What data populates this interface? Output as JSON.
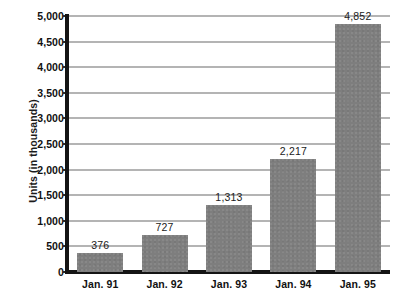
{
  "chart_data": {
    "type": "bar",
    "title": "",
    "subtitle": "",
    "xlabel": "",
    "ylabel": "Units (in thousands)",
    "categories": [
      "Jan. 91",
      "Jan. 92",
      "Jan. 93",
      "Jan. 94",
      "Jan. 95"
    ],
    "values": [
      376,
      727,
      1313,
      2217,
      4852
    ],
    "value_labels": [
      "376",
      "727",
      "1,313",
      "2,217",
      "4,852"
    ],
    "ylim": [
      0,
      5000
    ],
    "ytick_step": 500,
    "yticks": [
      0,
      500,
      1000,
      1500,
      2000,
      2500,
      3000,
      3500,
      4000,
      4500,
      5000
    ],
    "ytick_labels": [
      "0",
      "500",
      "1,000",
      "1,500",
      "2,000",
      "2,500",
      "3,000",
      "3,500",
      "4,000",
      "4,500",
      "5,000"
    ],
    "grid": true,
    "grid_axis": "y",
    "legend": false,
    "legend_position": "none",
    "bar_color": "#7e7e7e",
    "grid_color": "#b4b4b4",
    "axis_color": "#141414",
    "background_color": "#ffffff",
    "text_color": "#111111"
  }
}
